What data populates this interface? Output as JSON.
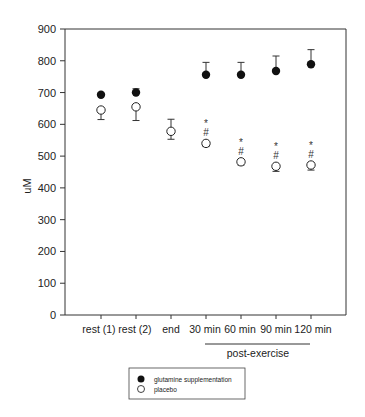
{
  "chart_data": {
    "type": "scatter",
    "title": "",
    "xlabel": "",
    "ylabel": "uM",
    "ylim": [
      0,
      900
    ],
    "yticks": [
      0,
      100,
      200,
      300,
      400,
      500,
      600,
      700,
      800,
      900
    ],
    "grid": false,
    "legend_position": "bottom-center (outside plot)",
    "categories": [
      "rest (1)",
      "rest (2)",
      "end",
      "30 min",
      "60 min",
      "90 min",
      "120 min"
    ],
    "group_annotation": {
      "label": "post-exercise",
      "spans": [
        "30 min",
        "60 min",
        "90 min",
        "120 min"
      ]
    },
    "series": [
      {
        "name": "glutamine supplementation",
        "marker": "filled-circle",
        "values": [
          693,
          700,
          576,
          756,
          756,
          768,
          789
        ],
        "error_upper": [
          null,
          712,
          null,
          795,
          795,
          815,
          835
        ]
      },
      {
        "name": "placebo",
        "marker": "open-circle",
        "values": [
          645,
          655,
          578,
          540,
          482,
          468,
          472
        ],
        "error_lower": [
          615,
          612,
          553,
          530,
          472,
          452,
          456
        ],
        "error_upper": [
          null,
          null,
          616,
          null,
          null,
          null,
          null
        ],
        "annotations": [
          null,
          null,
          null,
          "* #",
          "* #",
          "* #",
          "* #"
        ]
      }
    ]
  },
  "axis": {
    "y_label": "uM",
    "y_ticks": [
      "0",
      "100",
      "200",
      "300",
      "400",
      "500",
      "600",
      "700",
      "800",
      "900"
    ],
    "x_labels": [
      "rest (1)",
      "rest (2)",
      "end",
      "30 min",
      "60 min",
      "90 min",
      "120 min"
    ],
    "group_label": "post-exercise"
  },
  "annotations": {
    "star": "*",
    "hash": "#"
  },
  "legend": {
    "items": [
      {
        "label": "glutamine supplementation",
        "marker": "filled-circle"
      },
      {
        "label": "placebo",
        "marker": "open-circle"
      }
    ]
  }
}
